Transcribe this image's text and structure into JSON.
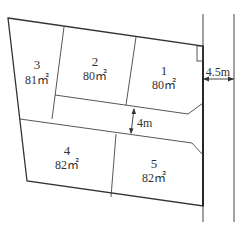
{
  "diagram": {
    "type": "land-subdivision-plan",
    "colors": {
      "line": "#333333",
      "background": "#ffffff"
    },
    "lots": [
      {
        "id": "1",
        "area": "80㎡"
      },
      {
        "id": "2",
        "area": "80㎡"
      },
      {
        "id": "3",
        "area": "81㎡"
      },
      {
        "id": "4",
        "area": "82㎡"
      },
      {
        "id": "5",
        "area": "82㎡"
      }
    ],
    "dimensions": {
      "private_road_width": "4m",
      "public_road_width": "4.5m"
    }
  }
}
